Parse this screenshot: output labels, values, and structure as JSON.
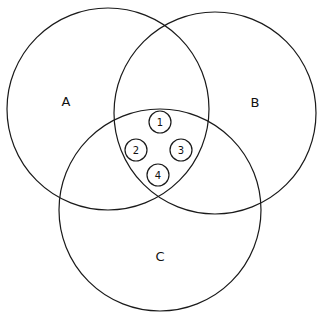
{
  "diagram": {
    "type": "venn",
    "sets": [
      {
        "label": "A",
        "cx": 108,
        "cy": 109,
        "r": 101,
        "label_x": 66,
        "label_y": 101
      },
      {
        "label": "B",
        "cx": 215,
        "cy": 113,
        "r": 101,
        "label_x": 255,
        "label_y": 102
      },
      {
        "label": "C",
        "cx": 160,
        "cy": 210,
        "r": 101,
        "label_x": 160,
        "label_y": 256
      }
    ],
    "intersection_items": [
      {
        "label": "1",
        "cx": 160,
        "cy": 122,
        "r": 11
      },
      {
        "label": "2",
        "cx": 136,
        "cy": 150,
        "r": 11
      },
      {
        "label": "3",
        "cx": 181,
        "cy": 150,
        "r": 11
      },
      {
        "label": "4",
        "cx": 158,
        "cy": 175,
        "r": 11
      }
    ],
    "colors": {
      "stroke": "#1a1a1a",
      "background": "#ffffff"
    }
  }
}
